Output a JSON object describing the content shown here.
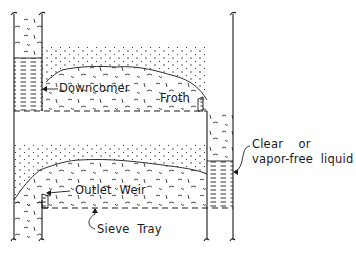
{
  "diagram": {
    "type": "sieve-tray-column-cross-section",
    "labels": {
      "downcomer": "Downcomer",
      "froth": "Froth",
      "clear_liquid_line1": "Clear    or",
      "clear_liquid_line2": "vapor-free  liquid",
      "outlet_weir": "Outlet  Weir",
      "sieve_tray": "Sieve  Tray"
    },
    "components": [
      "column-wall-left",
      "column-wall-right",
      "upper-tray",
      "lower-tray",
      "downcomer-left",
      "downcomer-right",
      "outlet-weir-upper",
      "outlet-weir-lower",
      "froth-upper",
      "froth-lower",
      "spray-upper",
      "spray-lower",
      "clear-liquid-left",
      "clear-liquid-right"
    ],
    "colors": {
      "ink": "#1a1a1a",
      "background": "#ffffff"
    }
  }
}
